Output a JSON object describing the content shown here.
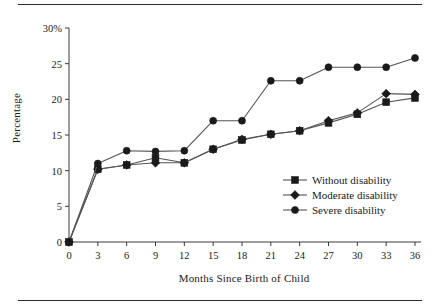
{
  "figure": {
    "has_top_rule": true,
    "has_bottom_rule": true,
    "ink_color": "#1a1a1a",
    "line_color": "#555555"
  },
  "axis": {
    "y_title": "Percentage",
    "x_title": "Months Since Birth of Child",
    "y_ticks": [
      "30%",
      "25",
      "20",
      "15",
      "10",
      "5",
      "0"
    ],
    "y_tick_values": [
      30,
      25,
      20,
      15,
      10,
      5,
      0
    ],
    "x_ticks": [
      "0",
      "3",
      "6",
      "9",
      "12",
      "15",
      "18",
      "21",
      "24",
      "27",
      "30",
      "33",
      "36"
    ]
  },
  "legend": {
    "position": "inside-lower-right",
    "entries": [
      {
        "label": "Without disability",
        "marker": "square-marker-icon"
      },
      {
        "label": "Moderate disability",
        "marker": "diamond-marker-icon"
      },
      {
        "label": "Severe disability",
        "marker": "circle-marker-icon"
      }
    ]
  },
  "chart_data": {
    "type": "line",
    "title": "",
    "xlabel": "Months Since Birth of Child",
    "ylabel": "Percentage",
    "xlim": [
      0,
      36
    ],
    "ylim": [
      0,
      30
    ],
    "grid": false,
    "legend_position": "lower right (inside axes)",
    "x": [
      0,
      3,
      6,
      9,
      12,
      15,
      18,
      21,
      24,
      27,
      30,
      33,
      36
    ],
    "series": [
      {
        "name": "Without disability",
        "marker": "square",
        "values": [
          0,
          10.2,
          10.8,
          11.8,
          11.1,
          13.0,
          14.3,
          15.1,
          15.6,
          16.7,
          17.9,
          19.6,
          20.2
        ]
      },
      {
        "name": "Moderate disability",
        "marker": "diamond",
        "values": [
          0,
          10.2,
          10.8,
          11.1,
          11.1,
          13.0,
          14.4,
          15.1,
          15.6,
          17.0,
          18.1,
          20.8,
          20.7
        ]
      },
      {
        "name": "Severe disability",
        "marker": "circle",
        "values": [
          0,
          11.0,
          12.8,
          12.7,
          12.8,
          17.0,
          17.0,
          22.6,
          22.6,
          24.5,
          24.5,
          24.5,
          25.8
        ]
      }
    ]
  }
}
